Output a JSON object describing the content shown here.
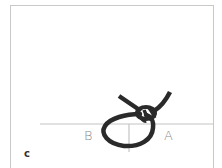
{
  "figure": {
    "panel_label": "c",
    "labels": {
      "left": "B",
      "right": "A"
    },
    "colors": {
      "rope": "#2a2a2a",
      "guide_lines": "#c4c4c4",
      "frame": "#c9c9c9",
      "label_text": "#8a8a8a",
      "background": "#ffffff"
    }
  }
}
